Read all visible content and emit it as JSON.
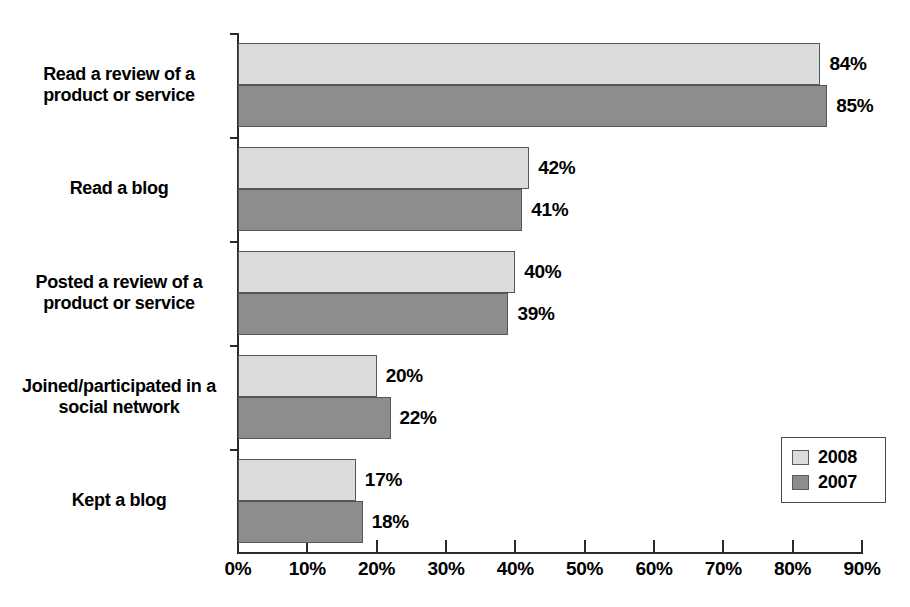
{
  "chart_data": {
    "type": "bar",
    "orientation": "horizontal",
    "title": "",
    "xlabel": "",
    "ylabel": "",
    "xlim": [
      0,
      90
    ],
    "grid": false,
    "legend_position": "bottom-right",
    "categories": [
      "Read a review of a product or service",
      "Read a blog",
      "Posted a review of a product or service",
      "Joined/participated in a social network",
      "Kept a blog"
    ],
    "category_lines": [
      [
        "Read a review of a",
        "product or service"
      ],
      [
        "Read a blog"
      ],
      [
        "Posted a review of a",
        "product or service"
      ],
      [
        "Joined/participated in a",
        "social network"
      ],
      [
        "Kept a blog"
      ]
    ],
    "series": [
      {
        "name": "2008",
        "color": "#dcdcdc",
        "values": [
          84,
          42,
          40,
          20,
          17
        ],
        "labels": [
          "84%",
          "42%",
          "40%",
          "20%",
          "17%"
        ]
      },
      {
        "name": "2007",
        "color": "#8d8d8d",
        "values": [
          85,
          41,
          39,
          22,
          18
        ],
        "labels": [
          "85%",
          "41%",
          "39%",
          "22%",
          "18%"
        ]
      }
    ],
    "xticks": [
      0,
      10,
      20,
      30,
      40,
      50,
      60,
      70,
      80,
      90
    ],
    "xtick_labels": [
      "0%",
      "10%",
      "20%",
      "30%",
      "40%",
      "50%",
      "60%",
      "70%",
      "80%",
      "90%"
    ]
  },
  "legend": {
    "items": [
      {
        "label": "2008",
        "color": "#dcdcdc"
      },
      {
        "label": "2007",
        "color": "#8d8d8d"
      }
    ]
  },
  "colors": {
    "series_2008": "#dcdcdc",
    "series_2007": "#8d8d8d",
    "axis": "#2b2b2b",
    "text": "#000000",
    "background": "#ffffff"
  }
}
